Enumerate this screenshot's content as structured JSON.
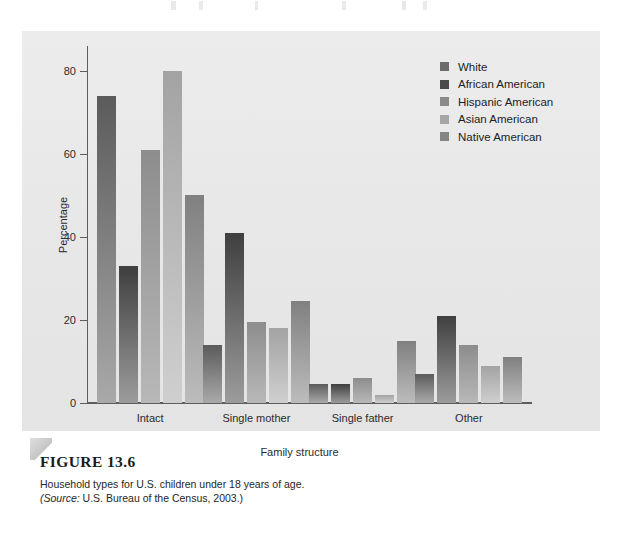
{
  "figure": {
    "label": "FIGURE 13.6",
    "description": "Household types for U.S. children under 18 years of age.",
    "source_prefix": "(Source:",
    "source_text": " U.S. Bureau of the Census, 2003.)"
  },
  "chart_data": {
    "type": "bar",
    "title": "",
    "xlabel": "Family structure",
    "ylabel": "Percentage",
    "categories": [
      "Intact",
      "Single mother",
      "Single father",
      "Other"
    ],
    "ylim": [
      0,
      86
    ],
    "yticks": [
      0,
      20,
      40,
      60,
      80
    ],
    "ytick_labels": [
      "0",
      "20",
      "40",
      "60",
      "80"
    ],
    "grid": false,
    "legend_position": "upper right",
    "series": [
      {
        "name": "White",
        "color": "#5b5b5b",
        "color_bottom": "#a9a9a9",
        "swatch": "#6b6b6b",
        "values": [
          74,
          14,
          4.5,
          7
        ]
      },
      {
        "name": "African American",
        "color": "#3f3f3f",
        "color_bottom": "#9c9c9c",
        "swatch": "#4a4a4a",
        "values": [
          33,
          41,
          4.5,
          21
        ]
      },
      {
        "name": "Hispanic American",
        "color": "#8d8d8d",
        "color_bottom": "#b8b8b8",
        "swatch": "#8a8a8a",
        "values": [
          61,
          19.5,
          6,
          14
        ]
      },
      {
        "name": "Asian American",
        "color": "#a3a3a3",
        "color_bottom": "#cfcfcf",
        "swatch": "#a6a6a6",
        "values": [
          80,
          18,
          2,
          9
        ]
      },
      {
        "name": "Native American",
        "color": "#808080",
        "color_bottom": "#bcbcbc",
        "swatch": "#858585",
        "values": [
          50,
          24.5,
          15,
          11
        ]
      }
    ]
  }
}
